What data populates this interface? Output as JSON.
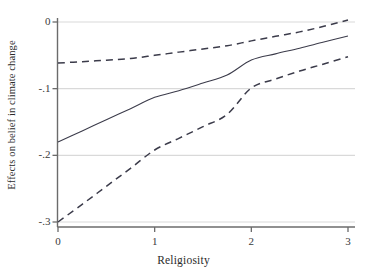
{
  "chart_data": {
    "type": "line",
    "title": "",
    "xlabel": "Religiosity",
    "ylabel": "Effects on belief in climate change",
    "xlim": [
      0,
      3
    ],
    "ylim": [
      -0.3,
      0.01
    ],
    "grid": "horizontal",
    "legend": "none",
    "xticks": [
      0,
      1,
      2,
      3
    ],
    "xticklabels": [
      "0",
      "1",
      "2",
      "3"
    ],
    "yticks": [
      0,
      -0.1,
      -0.2,
      -0.3
    ],
    "yticklabels": [
      "0",
      "-.1",
      "-.2",
      "-.3"
    ],
    "x": [
      0,
      0.25,
      0.5,
      0.75,
      1,
      1.25,
      1.5,
      1.75,
      2,
      2.25,
      2.5,
      2.75,
      3
    ],
    "series": [
      {
        "name": "Upper 95% confidence bound",
        "style": "dashed",
        "values": [
          -0.0615,
          -0.0595,
          -0.0572,
          -0.0548,
          -0.05,
          -0.0452,
          -0.0404,
          -0.0356,
          -0.0283,
          -0.0215,
          -0.0148,
          -0.0065,
          0.003
        ]
      },
      {
        "name": "Marginal effect (point estimate)",
        "style": "solid",
        "values": [
          -0.18,
          -0.1635,
          -0.1465,
          -0.13,
          -0.113,
          -0.103,
          -0.0915,
          -0.0795,
          -0.057,
          -0.0478,
          -0.0393,
          -0.03,
          -0.021
        ]
      },
      {
        "name": "Lower 95% confidence bound",
        "style": "dashed",
        "values": [
          -0.3,
          -0.2735,
          -0.2465,
          -0.2195,
          -0.192,
          -0.1745,
          -0.157,
          -0.1385,
          -0.099,
          -0.0855,
          -0.0735,
          -0.063,
          -0.052
        ]
      }
    ],
    "colors": {
      "line": "#3b3b4a",
      "grid": "#d9d9d9",
      "axis": "#6b6b6b",
      "text": "#2b2b2b",
      "background": "#ffffff"
    }
  }
}
